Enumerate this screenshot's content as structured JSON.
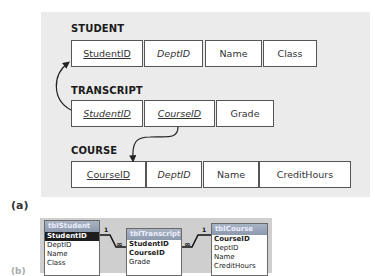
{
  "figure": {
    "part_a_label": "(a)",
    "part_b_label": "(b)"
  },
  "schema": {
    "tables": [
      {
        "name": "STUDENT",
        "fields": [
          {
            "label": "StudentID",
            "style": "underline"
          },
          {
            "label": "DeptID",
            "style": "italic"
          },
          {
            "label": "Name",
            "style": "normal"
          },
          {
            "label": "Class",
            "style": "normal"
          }
        ]
      },
      {
        "name": "TRANSCRIPT",
        "fields": [
          {
            "label": "StudentID",
            "style": "underline-italic"
          },
          {
            "label": "CourseID",
            "style": "underline-italic"
          },
          {
            "label": "Grade",
            "style": "normal"
          }
        ]
      },
      {
        "name": "COURSE",
        "fields": [
          {
            "label": "CourseID",
            "style": "underline"
          },
          {
            "label": "DeptID",
            "style": "italic"
          },
          {
            "label": "Name",
            "style": "normal"
          },
          {
            "label": "CreditHours",
            "style": "normal"
          }
        ]
      }
    ],
    "relationships": [
      {
        "from": "TRANSCRIPT.StudentID",
        "to": "STUDENT.StudentID"
      },
      {
        "from": "TRANSCRIPT.CourseID",
        "to": "COURSE.CourseID"
      }
    ]
  },
  "access_relationships": {
    "tables": [
      {
        "title": "tblStudent",
        "fields": [
          "StudentID",
          "DeptID",
          "Name",
          "Class"
        ]
      },
      {
        "title": "tblTranscript",
        "fields": [
          "StudentID",
          "CourseID",
          "Grade"
        ]
      },
      {
        "title": "tblCourse",
        "fields": [
          "CourseID",
          "DeptID",
          "Name",
          "CreditHours"
        ]
      }
    ],
    "links": [
      {
        "one": "1",
        "many": "∞"
      },
      {
        "one": "1",
        "many": "∞"
      }
    ]
  }
}
